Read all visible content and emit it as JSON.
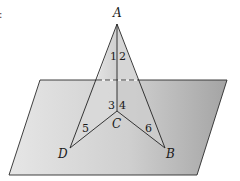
{
  "figure": {
    "type": "geometry-3d",
    "colors": {
      "plane_light": "#e4e4e4",
      "plane_dark": "#a9a9a9",
      "triangle_fill": "#dcdcdc",
      "stroke": "#222222"
    },
    "points": {
      "A": {
        "label": "A",
        "x": 117,
        "y": 24
      },
      "B": {
        "label": "B",
        "x": 165,
        "y": 148
      },
      "C": {
        "label": "C",
        "x": 117,
        "y": 111
      },
      "D": {
        "label": "D",
        "x": 70,
        "y": 148
      }
    },
    "plane": {
      "corners": [
        [
          40,
          80
        ],
        [
          227,
          80
        ],
        [
          197,
          175
        ],
        [
          9,
          175
        ]
      ]
    },
    "angles": [
      {
        "label": "1"
      },
      {
        "label": "2"
      },
      {
        "label": "3"
      },
      {
        "label": "4"
      },
      {
        "label": "5"
      },
      {
        "label": "6"
      }
    ],
    "edge_fragment": ":"
  }
}
